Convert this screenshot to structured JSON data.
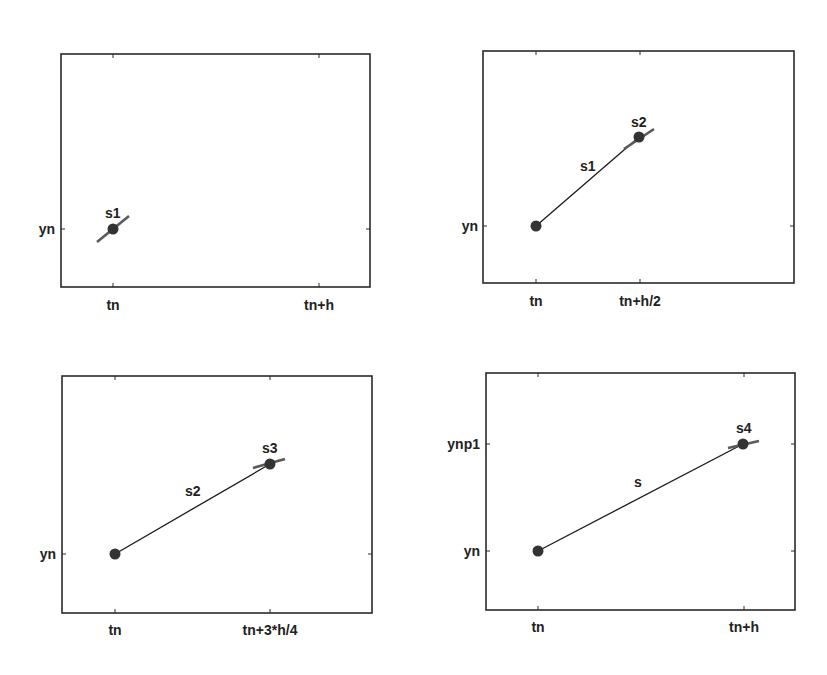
{
  "panels": [
    {
      "id": "panel-1",
      "xticks": [
        "tn",
        "tn+h"
      ],
      "yticks": [
        "yn"
      ],
      "slope_label": "s1",
      "segment_label": ""
    },
    {
      "id": "panel-2",
      "xticks": [
        "tn",
        "tn+h/2"
      ],
      "yticks": [
        "yn"
      ],
      "slope_label": "s2",
      "segment_label": "s1"
    },
    {
      "id": "panel-3",
      "xticks": [
        "tn",
        "tn+3*h/4"
      ],
      "yticks": [
        "yn"
      ],
      "slope_label": "s3",
      "segment_label": "s2"
    },
    {
      "id": "panel-4",
      "xticks": [
        "tn",
        "tn+h"
      ],
      "yticks": [
        "yn",
        "ynp1"
      ],
      "slope_label": "s4",
      "segment_label": "s"
    }
  ],
  "colors": {
    "axes": "#2a2a2a",
    "line": "#1a1a1a",
    "slope": "#5a5a5a",
    "marker": "#333333"
  }
}
